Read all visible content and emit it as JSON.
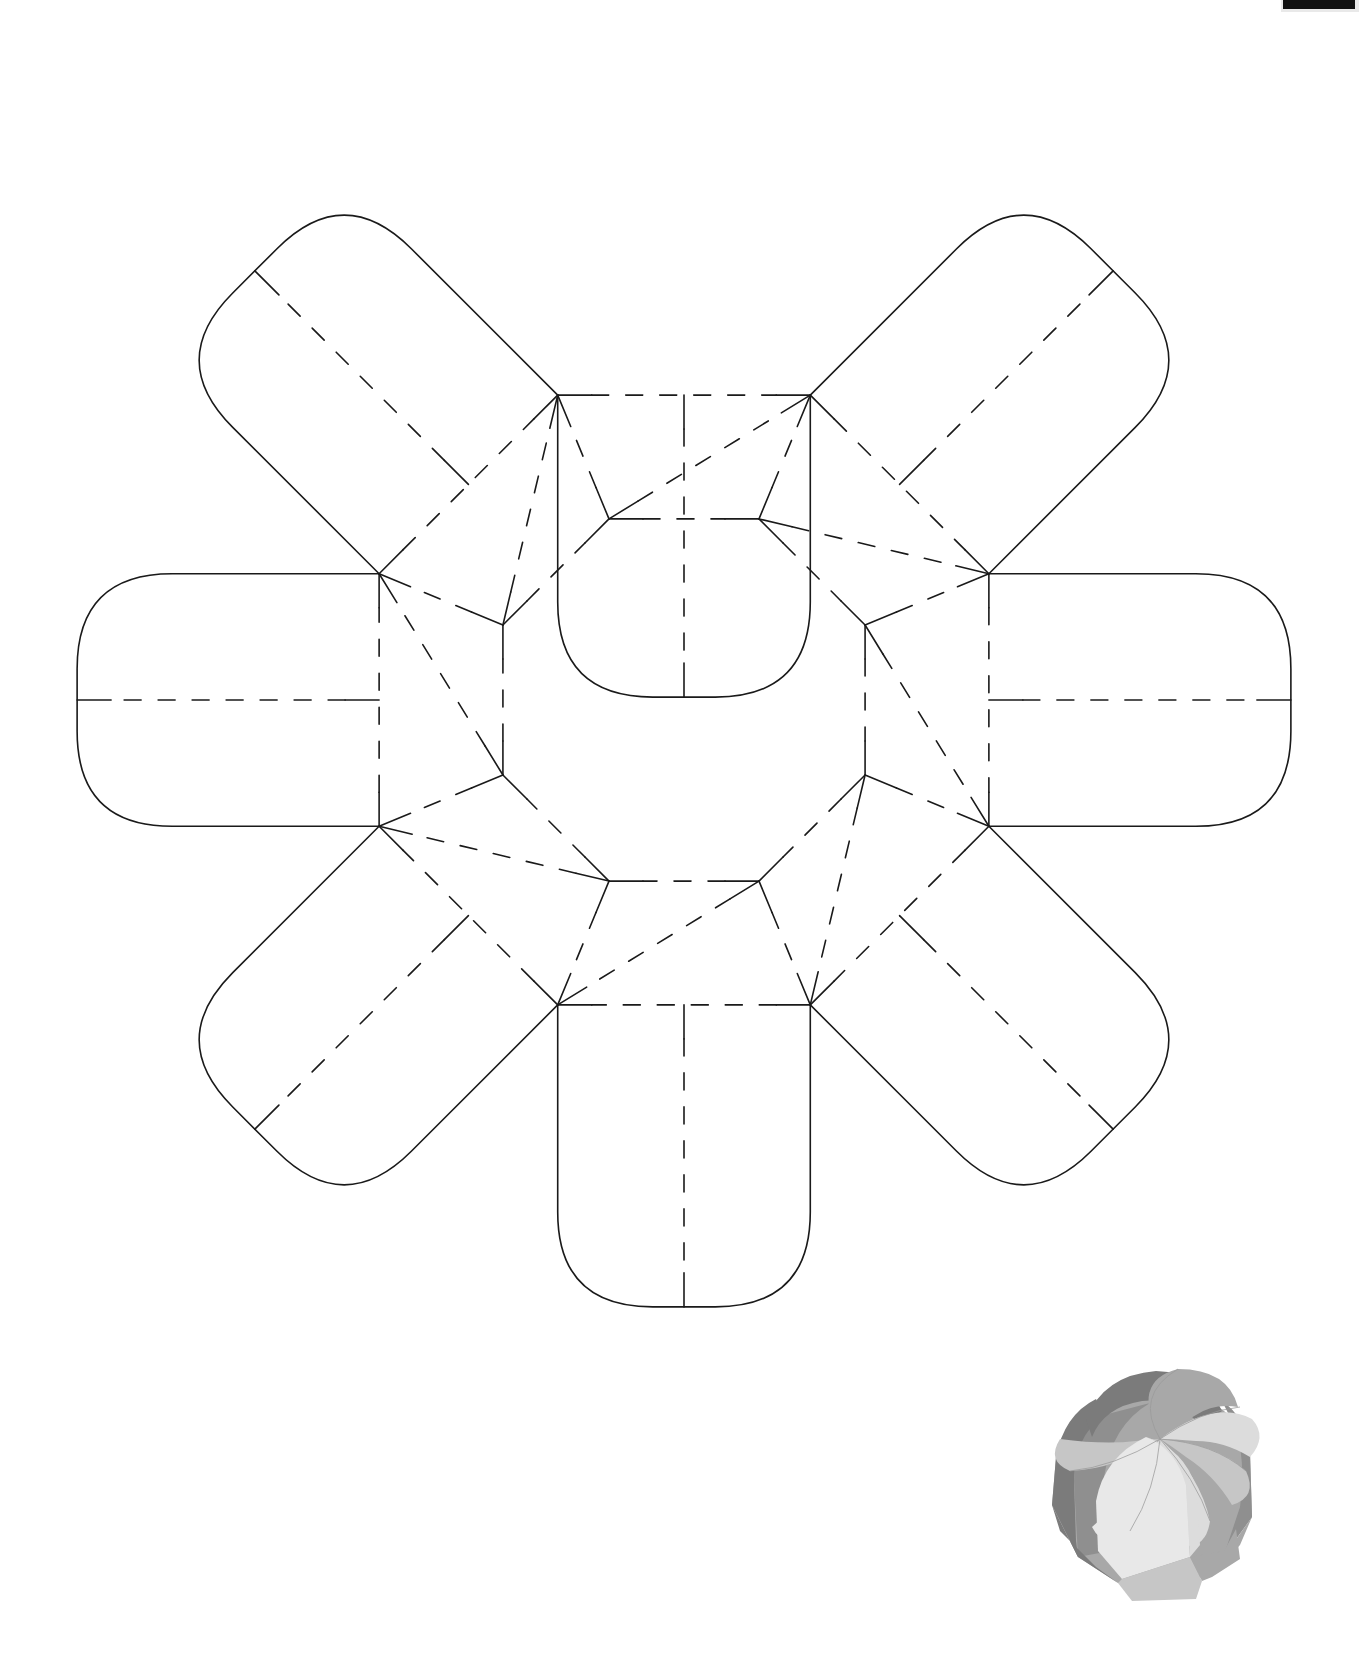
{
  "document": {
    "kind": "papercraft-cut-and-fold-template",
    "subject": "octagonal pinwheel gift box",
    "page_width": 1369,
    "page_height": 1658,
    "background_color": "#ffffff",
    "line_color": "#1a1a1a",
    "cut_line_style": "solid",
    "fold_line_style": "dashed"
  },
  "template": {
    "name": "flower-net-8-petal",
    "center_x": 684,
    "center_y": 700,
    "petal_count": 8,
    "inner_octagon_radius": 196,
    "mid_octagon_radius": 330,
    "petal_outer_radius": 632,
    "rotation_offset_deg": 22.5,
    "petal_corner_radius": 95,
    "stroke_width": 1.6,
    "fold_dash": "17 17",
    "tick_length": 34
  },
  "top_marker": {
    "label": "page-edge-crop-bar",
    "color": "#111111",
    "x": 1283,
    "y": 0,
    "width": 72,
    "height": 9
  },
  "preview": {
    "label": "assembled-box-preview",
    "description": "folded octagonal gift box with pinwheel top closure",
    "x": 1000,
    "y": 1345,
    "width": 290,
    "height": 260,
    "palette": {
      "shade_darkest": "#7b7b7b",
      "shade_dark": "#8f8f8f",
      "shade_mid": "#a8a8a8",
      "shade_light": "#c6c6c6",
      "shade_lightest": "#dcdcdc",
      "shade_white": "#e8e8e8",
      "outline": "#9a9a9a"
    }
  },
  "chart_data": {
    "type": "table",
    "categories": [
      "petal-1-top",
      "petal-2-upper-right",
      "petal-3-right",
      "petal-4-lower-right",
      "petal-5-bottom",
      "petal-6-lower-left",
      "petal-7-left",
      "petal-8-upper-left"
    ],
    "values": [
      1,
      1,
      1,
      1,
      1,
      1,
      1,
      1
    ],
    "xlabel": "petal",
    "ylabel": "count",
    "notes": [
      "8 identical petals radiating from a central regular octagon",
      "dashed lines = fold (score) lines",
      "solid lines = cut lines",
      "each petal has one radial fold and one chord fold forming the pinwheel lock",
      "small tick marks mark score-line endpoints at each vertex"
    ]
  }
}
